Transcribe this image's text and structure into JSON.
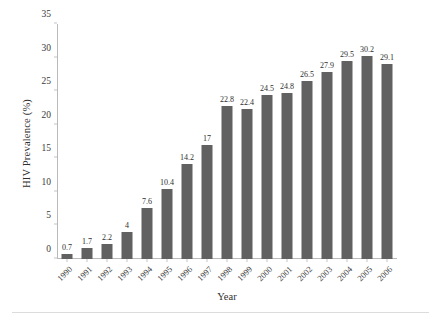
{
  "chart_data": {
    "type": "bar",
    "title": "",
    "xlabel": "Year",
    "ylabel": "HIV Prevalence (%)",
    "categories": [
      "1990",
      "1991",
      "1992",
      "1993",
      "1994",
      "1995",
      "1996",
      "1997",
      "1998",
      "1999",
      "2000",
      "2001",
      "2002",
      "2003",
      "2004",
      "2005",
      "2006"
    ],
    "values": [
      0.7,
      1.7,
      2.2,
      4,
      7.6,
      10.4,
      14.2,
      17,
      22.8,
      22.4,
      24.5,
      24.8,
      26.5,
      27.9,
      29.5,
      30.2,
      29.1
    ],
    "value_labels": [
      "0.7",
      "1.7",
      "2.2",
      "4",
      "7.6",
      "10.4",
      "14.2",
      "17",
      "22.8",
      "22.4",
      "24.5",
      "24.8",
      "26.5",
      "27.9",
      "29.5",
      "30.2",
      "29.1"
    ],
    "ylim": [
      0,
      35
    ],
    "yticks": [
      0,
      5,
      10,
      15,
      20,
      25,
      30,
      35
    ],
    "ytick_labels": [
      "0",
      "5",
      "10",
      "15",
      "20",
      "25",
      "30",
      "35"
    ],
    "grid": false,
    "legend": false,
    "bar_color": "#616161",
    "axis_color": "#b9b9b9",
    "background": "#ffffff"
  }
}
